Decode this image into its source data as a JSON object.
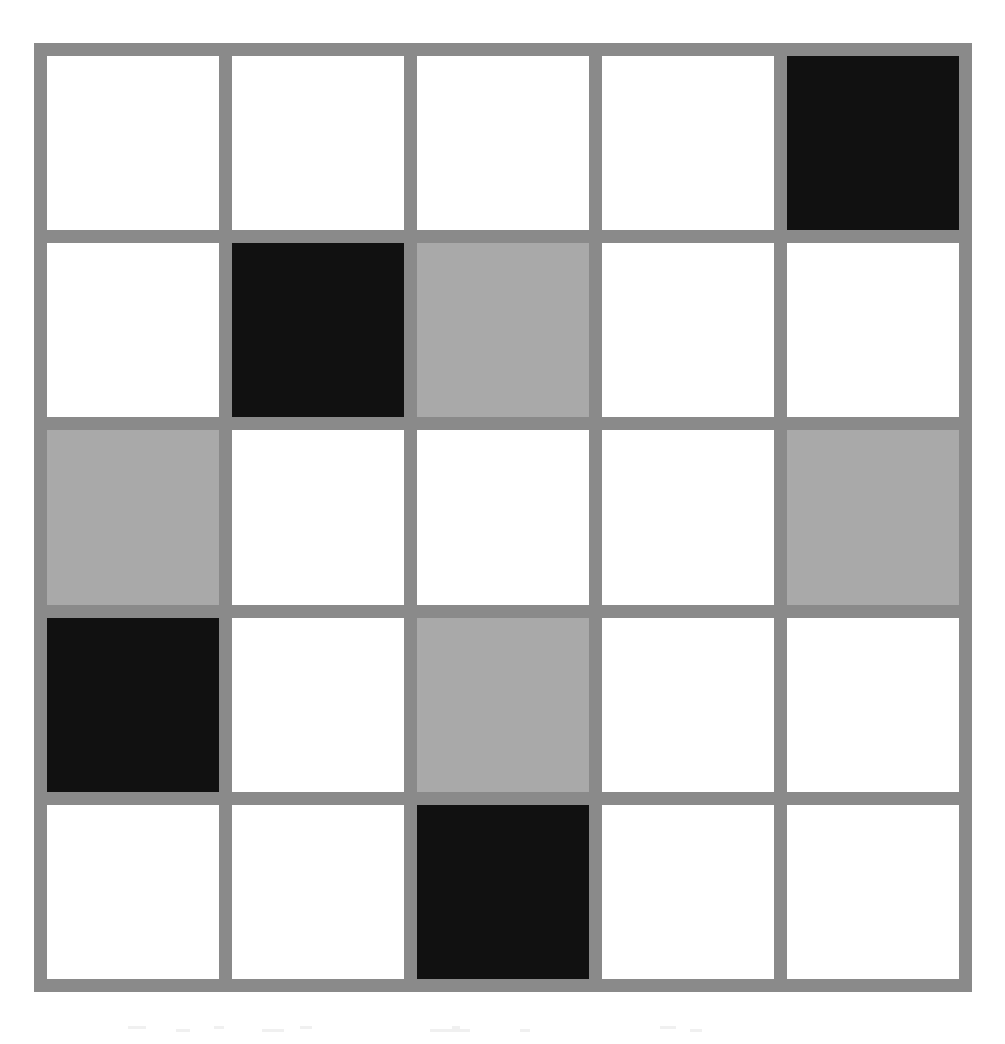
{
  "figure": {
    "name": "five-by-five-shaded-grid",
    "rows": 5,
    "columns": 5,
    "border_color": "#8a8a8a",
    "gutter_color": "#8a8a8a",
    "background_color": "#ffffff",
    "cell_colors": {
      "white": "#ffffff",
      "gray": "#a9a9a9",
      "black": "#111111"
    },
    "legend": {
      "white_label": "empty",
      "gray_label": "half-shaded",
      "black_label": "fully-shaded"
    },
    "counts": {
      "white": 16,
      "gray": 5,
      "black": 4,
      "total": 25
    }
  },
  "chart_data": {
    "type": "heatmap",
    "title": "",
    "xlabel": "",
    "ylabel": "",
    "categories": [
      "1",
      "2",
      "3",
      "4",
      "5"
    ],
    "row_labels": [
      "1",
      "2",
      "3",
      "4",
      "5"
    ],
    "legend_position": "none",
    "grid": true,
    "value_map": {
      "0": "white",
      "1": "gray",
      "2": "black"
    },
    "values": [
      [
        0,
        0,
        0,
        0,
        2
      ],
      [
        0,
        2,
        1,
        0,
        0
      ],
      [
        1,
        0,
        0,
        0,
        1
      ],
      [
        2,
        0,
        1,
        0,
        0
      ],
      [
        0,
        0,
        2,
        0,
        0
      ]
    ],
    "cells": [
      {
        "row": 1,
        "col": 1,
        "state": "white"
      },
      {
        "row": 1,
        "col": 2,
        "state": "white"
      },
      {
        "row": 1,
        "col": 3,
        "state": "white"
      },
      {
        "row": 1,
        "col": 4,
        "state": "white"
      },
      {
        "row": 1,
        "col": 5,
        "state": "black"
      },
      {
        "row": 2,
        "col": 1,
        "state": "white"
      },
      {
        "row": 2,
        "col": 2,
        "state": "black"
      },
      {
        "row": 2,
        "col": 3,
        "state": "gray"
      },
      {
        "row": 2,
        "col": 4,
        "state": "white"
      },
      {
        "row": 2,
        "col": 5,
        "state": "white"
      },
      {
        "row": 3,
        "col": 1,
        "state": "gray"
      },
      {
        "row": 3,
        "col": 2,
        "state": "white"
      },
      {
        "row": 3,
        "col": 3,
        "state": "white"
      },
      {
        "row": 3,
        "col": 4,
        "state": "white"
      },
      {
        "row": 3,
        "col": 5,
        "state": "gray"
      },
      {
        "row": 4,
        "col": 1,
        "state": "black"
      },
      {
        "row": 4,
        "col": 2,
        "state": "white"
      },
      {
        "row": 4,
        "col": 3,
        "state": "gray"
      },
      {
        "row": 4,
        "col": 4,
        "state": "white"
      },
      {
        "row": 4,
        "col": 5,
        "state": "white"
      },
      {
        "row": 5,
        "col": 1,
        "state": "white"
      },
      {
        "row": 5,
        "col": 2,
        "state": "white"
      },
      {
        "row": 5,
        "col": 3,
        "state": "black"
      },
      {
        "row": 5,
        "col": 4,
        "state": "white"
      },
      {
        "row": 5,
        "col": 5,
        "state": "white"
      }
    ]
  }
}
